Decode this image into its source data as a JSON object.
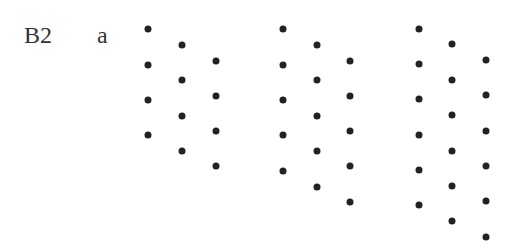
{
  "problem_label": "B2",
  "part_label": "a",
  "dot_color": "#222222",
  "patterns": [
    {
      "name": "pattern-1",
      "dots_per_column": 4,
      "columns": [
        {
          "x": 148,
          "ys": [
            29,
            65,
            100,
            135
          ]
        },
        {
          "x": 182,
          "ys": [
            45,
            80,
            116,
            151
          ]
        },
        {
          "x": 216,
          "ys": [
            61,
            96,
            131,
            166
          ]
        }
      ]
    },
    {
      "name": "pattern-2",
      "dots_per_column": 5,
      "columns": [
        {
          "x": 283,
          "ys": [
            29,
            65,
            100,
            135,
            171
          ]
        },
        {
          "x": 317,
          "ys": [
            45,
            80,
            116,
            151,
            187
          ]
        },
        {
          "x": 350,
          "ys": [
            61,
            96,
            131,
            166,
            202
          ]
        }
      ]
    },
    {
      "name": "pattern-3",
      "dots_per_column": 6,
      "columns": [
        {
          "x": 419,
          "ys": [
            29,
            64,
            99,
            135,
            170,
            205
          ]
        },
        {
          "x": 452,
          "ys": [
            44,
            80,
            115,
            151,
            186,
            221
          ]
        },
        {
          "x": 486,
          "ys": [
            60,
            95,
            131,
            166,
            201,
            237
          ]
        }
      ]
    }
  ]
}
